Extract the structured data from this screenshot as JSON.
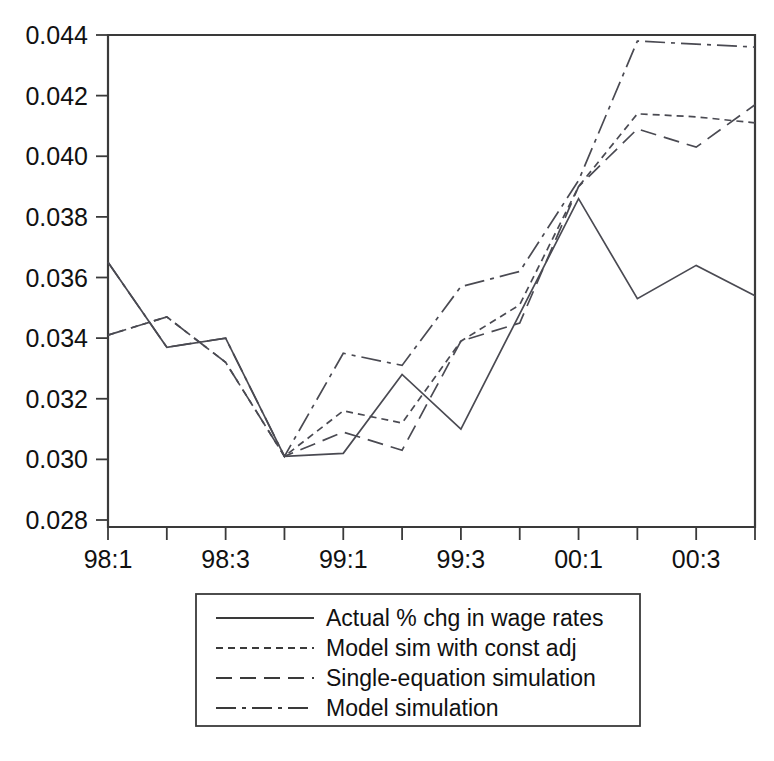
{
  "chart_data": {
    "type": "line",
    "title": "",
    "subtitle": "",
    "xlabel": "",
    "ylabel": "",
    "grid": false,
    "legend_position": "below-center",
    "x": [
      "98:1",
      "98:2",
      "98:3",
      "98:4",
      "99:1",
      "99:2",
      "99:3",
      "99:4",
      "00:1",
      "00:2",
      "00:3",
      "00:4"
    ],
    "categories": [
      "98:1",
      "98:2",
      "98:3",
      "98:4",
      "99:1",
      "99:2",
      "99:3",
      "99:4",
      "00:1",
      "00:2",
      "00:3",
      "00:4"
    ],
    "xtick_labels": [
      "98:1",
      "98:3",
      "99:1",
      "99:3",
      "00:1",
      "00:3"
    ],
    "xtick_label_indices": [
      0,
      2,
      4,
      6,
      8,
      10
    ],
    "ytick_labels": [
      "0.028",
      "0.030",
      "0.032",
      "0.034",
      "0.036",
      "0.038",
      "0.040",
      "0.042",
      "0.044"
    ],
    "ytick_values": [
      0.028,
      0.03,
      0.032,
      0.034,
      0.036,
      0.038,
      0.04,
      0.042,
      0.044
    ],
    "ylim": [
      0.028,
      0.044
    ],
    "xlim": [
      0,
      11
    ],
    "series": [
      {
        "name": "Actual % chg in wage rates",
        "dash": "solid",
        "dasharray": "none",
        "color": "#4a4a52",
        "values": [
          0.0365,
          0.0337,
          0.034,
          0.0301,
          0.0302,
          0.0328,
          0.031,
          0.0348,
          0.0386,
          0.0353,
          0.0364,
          0.0354
        ]
      },
      {
        "name": "Model sim with const adj",
        "dash": "short-dash",
        "dasharray": "7,5",
        "color": "#4a4a52",
        "values": [
          0.0341,
          0.0347,
          0.0332,
          0.0301,
          0.0316,
          0.0312,
          0.0339,
          0.0351,
          0.039,
          0.0414,
          0.0413,
          0.0411
        ]
      },
      {
        "name": "Single-equation simulation",
        "dash": "long-dash",
        "dasharray": "16,8",
        "color": "#4a4a52",
        "values": [
          0.0341,
          0.0347,
          0.0332,
          0.0301,
          0.0309,
          0.0303,
          0.0339,
          0.0345,
          0.039,
          0.0409,
          0.0403,
          0.0417
        ]
      },
      {
        "name": "Model simulation",
        "dash": "dash-dot",
        "dasharray": "20,6,4,6",
        "color": "#4a4a52",
        "values": [
          0.0365,
          0.0337,
          0.034,
          0.0301,
          0.0335,
          0.0331,
          0.0357,
          0.0362,
          0.0392,
          0.0438,
          0.0437,
          0.0436
        ]
      }
    ]
  },
  "legend": {
    "items": [
      {
        "label": "Actual % chg in wage rates",
        "dasharray": "none"
      },
      {
        "label": "Model sim with const adj",
        "dasharray": "7,5"
      },
      {
        "label": "Single-equation simulation",
        "dasharray": "16,8"
      },
      {
        "label": "Model simulation",
        "dasharray": "20,6,4,6"
      }
    ]
  },
  "colors": {
    "axis": "#3a3a3a",
    "line": "#4a4a52",
    "background": "#ffffff",
    "text": "#111111"
  }
}
